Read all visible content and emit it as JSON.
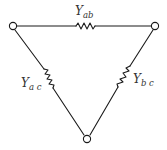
{
  "diagram": {
    "type": "delta-network",
    "nodes": [
      {
        "id": "a",
        "position": "top-left"
      },
      {
        "id": "b",
        "position": "top-right"
      },
      {
        "id": "c",
        "position": "bottom"
      }
    ],
    "branches": [
      {
        "id": "ab",
        "label_main": "Y",
        "label_sub": "ab",
        "between": [
          "a",
          "b"
        ]
      },
      {
        "id": "ac",
        "label_main": "Y",
        "label_sub": "a c",
        "between": [
          "a",
          "c"
        ]
      },
      {
        "id": "bc",
        "label_main": "Y",
        "label_sub": "b c",
        "between": [
          "b",
          "c"
        ]
      }
    ],
    "colors": {
      "stroke": "#1a1a1a",
      "text": "#333333",
      "background": "#ffffff"
    }
  }
}
